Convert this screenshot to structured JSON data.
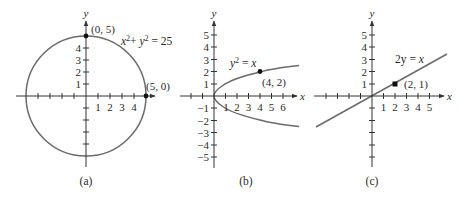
{
  "figure": {
    "panels": [
      {
        "id": "a",
        "caption": "(a)",
        "equation": "x²+ y²= 25",
        "equation_parts": {
          "x": "x",
          "sup1": "2",
          "plus": "+ ",
          "y": "y",
          "sup2": "2",
          "rhs": " = 25"
        },
        "x_axis_label": "x",
        "y_axis_label": "y",
        "x_tick_labels": [
          "1",
          "2",
          "3",
          "4"
        ],
        "y_tick_labels": [
          "1",
          "2",
          "3",
          "4"
        ],
        "points": [
          {
            "label": "(0, 5)",
            "x": 0,
            "y": 5
          },
          {
            "label": "(5, 0)",
            "x": 5,
            "y": 0
          }
        ]
      },
      {
        "id": "b",
        "caption": "(b)",
        "equation": "y² = x",
        "equation_parts": {
          "y": "y",
          "sup": "2",
          "rhs_eq": " = ",
          "rhs_var": "x"
        },
        "x_axis_label": "x",
        "y_axis_label": "y",
        "x_tick_labels": [
          "1",
          "2",
          "3",
          "4",
          "5",
          "6"
        ],
        "y_tick_labels": [
          "5",
          "4",
          "3",
          "2",
          "1",
          "−1",
          "−2",
          "−3",
          "−4",
          "−5"
        ],
        "points": [
          {
            "label": "(4, 2)",
            "x": 4,
            "y": 2
          }
        ]
      },
      {
        "id": "c",
        "caption": "(c)",
        "equation": "2y = x",
        "equation_parts": {
          "lhs": "2y = ",
          "rhs_var": "x"
        },
        "x_axis_label": "x",
        "y_axis_label": "y",
        "x_tick_labels": [
          "1",
          "2",
          "3",
          "4",
          "5"
        ],
        "y_tick_labels": [
          "5",
          "4",
          "3",
          "2",
          "1"
        ],
        "points": [
          {
            "label": "(2, 1)",
            "x": 2,
            "y": 1
          }
        ]
      }
    ],
    "colors": {
      "curve": "#6b6b6b",
      "axis": "#333333",
      "text": "#2a2a2a"
    }
  }
}
